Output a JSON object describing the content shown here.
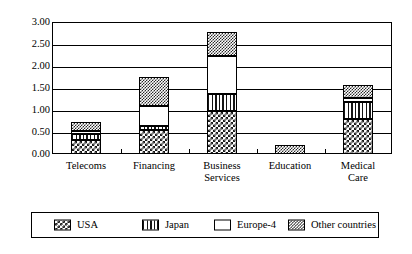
{
  "chart_data": {
    "type": "bar",
    "subtype": "stacked-bar",
    "title": "",
    "subtitle": "",
    "xlabel": "",
    "ylabel": "",
    "ylim": [
      0.0,
      3.0
    ],
    "ytick_step": 0.5,
    "ytick_labels": [
      "3.00",
      "2.50",
      "2.00",
      "1.50",
      "1.00",
      "0.50",
      "0.00"
    ],
    "ytick_values": [
      3.0,
      2.5,
      2.0,
      1.5,
      1.0,
      0.5,
      0.0
    ],
    "grid": true,
    "grid_axis": "y",
    "legend_position": "bottom",
    "categories": [
      "Telecoms",
      "Financing",
      "Business Services",
      "Education",
      "Medical Care"
    ],
    "category_lines": [
      [
        "Telecoms"
      ],
      [
        "Financing"
      ],
      [
        "Business",
        "Services"
      ],
      [
        "Education"
      ],
      [
        "Medical",
        "Care"
      ]
    ],
    "series": [
      {
        "name": "USA",
        "pattern": "checkerboard-dark",
        "values": [
          0.32,
          0.55,
          0.97,
          0.0,
          0.8
        ]
      },
      {
        "name": "Japan",
        "pattern": "vertical-stripes",
        "values": [
          0.13,
          0.08,
          0.4,
          0.0,
          0.38
        ]
      },
      {
        "name": "Europe-4",
        "pattern": "solid-white",
        "values": [
          0.08,
          0.45,
          0.85,
          0.0,
          0.1
        ]
      },
      {
        "name": "Other countries",
        "pattern": "fine-checkerboard",
        "values": [
          0.2,
          0.68,
          0.55,
          0.2,
          0.3
        ]
      }
    ],
    "totals": [
      0.73,
      1.76,
      2.77,
      0.2,
      1.58
    ]
  },
  "legend": {
    "items": [
      {
        "label": "USA"
      },
      {
        "label": "Japan"
      },
      {
        "label": "Europe-4"
      },
      {
        "label": "Other countries"
      }
    ]
  }
}
